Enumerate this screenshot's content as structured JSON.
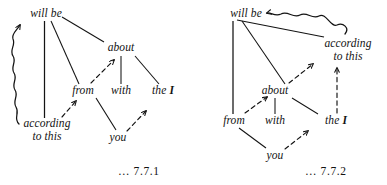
{
  "figure": {
    "type": "linguistic-dependency-diagram-pair"
  },
  "diagrams": [
    {
      "id": "7.7.1",
      "label": "… 7.7.1",
      "nodes": [
        {
          "id": "will_be",
          "text": "will be"
        },
        {
          "id": "about",
          "text": "about"
        },
        {
          "id": "from",
          "text": "from"
        },
        {
          "id": "with",
          "text": "with"
        },
        {
          "id": "the_I",
          "text": "the I",
          "emphasis": "I"
        },
        {
          "id": "according",
          "line1": "according",
          "line2": "to this"
        },
        {
          "id": "you",
          "text": "you"
        }
      ],
      "edges": [
        {
          "from": "will_be",
          "to": "about",
          "style": "solid"
        },
        {
          "from": "will_be",
          "to": "from",
          "style": "solid"
        },
        {
          "from": "will_be",
          "to": "according",
          "style": "solid"
        },
        {
          "from": "about",
          "to": "with",
          "style": "solid"
        },
        {
          "from": "about",
          "to": "the_I",
          "style": "solid"
        },
        {
          "from": "from",
          "to": "you",
          "style": "solid"
        },
        {
          "from": "from",
          "to": "about",
          "style": "dashed-arrow"
        },
        {
          "from": "according",
          "to": "from",
          "style": "dashed-arrow"
        },
        {
          "from": "you",
          "to": "the_I",
          "style": "dashed-arrow"
        },
        {
          "from": "according",
          "to": "will_be",
          "style": "wavy-arrow"
        }
      ]
    },
    {
      "id": "7.7.2",
      "label": "… 7.7.2",
      "nodes": [
        {
          "id": "will_be",
          "text": "will be"
        },
        {
          "id": "according",
          "line1": "according",
          "line2": "to this"
        },
        {
          "id": "about",
          "text": "about"
        },
        {
          "id": "from",
          "text": "from"
        },
        {
          "id": "with",
          "text": "with"
        },
        {
          "id": "the_I",
          "text": "the I",
          "emphasis": "I"
        },
        {
          "id": "you",
          "text": "you"
        }
      ],
      "edges": [
        {
          "from": "will_be",
          "to": "according",
          "style": "solid"
        },
        {
          "from": "will_be",
          "to": "from",
          "style": "solid"
        },
        {
          "from": "will_be",
          "to": "about",
          "style": "solid"
        },
        {
          "from": "about",
          "to": "with",
          "style": "solid"
        },
        {
          "from": "about",
          "to": "the_I",
          "style": "solid"
        },
        {
          "from": "from",
          "to": "you",
          "style": "solid"
        },
        {
          "from": "about",
          "to": "according",
          "style": "dashed-arrow"
        },
        {
          "from": "from",
          "to": "about",
          "style": "dashed-arrow"
        },
        {
          "from": "you",
          "to": "the_I",
          "style": "dashed-arrow"
        },
        {
          "from": "the_I",
          "to": "according",
          "style": "dashed-arrow"
        },
        {
          "from": "according",
          "to": "will_be",
          "style": "wavy-arrow"
        }
      ]
    }
  ],
  "colors": {
    "ink": "#131313",
    "background": "#ffffff"
  }
}
